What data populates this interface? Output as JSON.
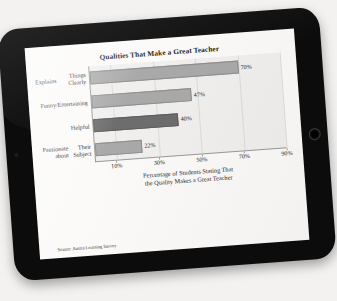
{
  "device": {
    "type": "tablet",
    "home_button": "home-button",
    "camera": "camera-dot"
  },
  "chart_data": {
    "type": "bar",
    "orientation": "horizontal",
    "title": "Qualities That Make a Great Teacher",
    "categories": [
      "Explains\nThings Clearly",
      "Funny/\nEntertaining",
      "Helpful",
      "Passionate about\nTheir Subject"
    ],
    "category_lines": [
      [
        "Explains",
        "Things Clearly"
      ],
      [
        "Funny/",
        "Entertaining"
      ],
      [
        "Helpful"
      ],
      [
        "Passionate about",
        "Their Subject"
      ]
    ],
    "values": [
      70,
      47,
      40,
      22
    ],
    "value_labels": [
      "70%",
      "47%",
      "40%",
      "22%"
    ],
    "highlight_index": 2,
    "xlabel": "Percentage of Students Stating That the Quality Makes a Great Teacher",
    "xlabel_lines": [
      "Percentage of Students Stating That",
      "the Quality Makes a Great Teacher"
    ],
    "ylabel": "",
    "xlim": [
      0,
      90
    ],
    "xticks": [
      10,
      30,
      50,
      70,
      90
    ],
    "xtick_labels": [
      "10%",
      "30%",
      "50%",
      "70%",
      "90%"
    ],
    "grid": true,
    "legend": null,
    "source": "Source: Austin Learning Survey",
    "colors": {
      "bar": "#a9a9a9",
      "bar_highlight": "#6d6d6d",
      "plot_background": "#f0efed",
      "page_background": "#fbfaf8",
      "axis": "#9a9a9a",
      "text": "#242424",
      "device_frame": "#0d0c0c"
    }
  }
}
